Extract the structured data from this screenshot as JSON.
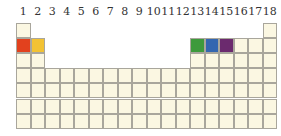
{
  "group_labels": [
    "1",
    "2",
    "3",
    "4",
    "5",
    "6",
    "7",
    "8",
    "9",
    "10",
    "11",
    "12",
    "13",
    "14",
    "15",
    "16",
    "17",
    "18"
  ],
  "colors": {
    "empty": "#fbf7e2",
    "border": "#a9a69c",
    "group1_period2": "#e2411e",
    "group2_period2": "#f2c233",
    "group13_period2": "#3e9a3c",
    "group14_period2": "#3466b0",
    "group15_period2": "#6b2a6e"
  },
  "highlighted_cells": [
    {
      "group": 1,
      "period": 2,
      "color": "#e2411e"
    },
    {
      "group": 2,
      "period": 2,
      "color": "#f2c233"
    },
    {
      "group": 13,
      "period": 2,
      "color": "#3e9a3c"
    },
    {
      "group": 14,
      "period": 2,
      "color": "#3466b0"
    },
    {
      "group": 15,
      "period": 2,
      "color": "#6b2a6e"
    }
  ],
  "periods": 7
}
